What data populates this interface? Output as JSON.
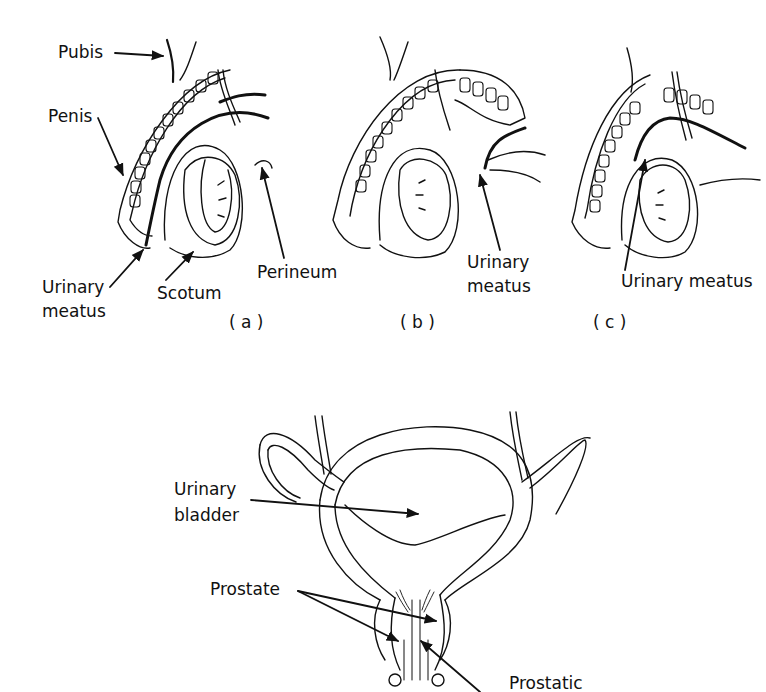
{
  "figure_top": {
    "panels": [
      {
        "caption": "( a )",
        "labels": {
          "pubis": "Pubis",
          "penis": "Penis",
          "urinary_meatus_line1": "Urinary",
          "urinary_meatus_line2": "meatus",
          "scrotum": "Scotum",
          "perineum": "Perineum"
        }
      },
      {
        "caption": "( b )",
        "labels": {
          "urinary_meatus_line1": "Urinary",
          "urinary_meatus_line2": "meatus"
        }
      },
      {
        "caption": "( c )",
        "labels": {
          "urinary_meatus": "Urinary  meatus"
        }
      }
    ]
  },
  "figure_bottom": {
    "labels": {
      "urinary_bladder_line1": "Urinary",
      "urinary_bladder_line2": "bladder",
      "prostate": "Prostate",
      "prostatic": "Prostatic"
    }
  },
  "colors": {
    "ink": "#111111",
    "background": "#ffffff"
  }
}
